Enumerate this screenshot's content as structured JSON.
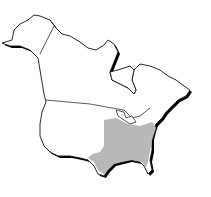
{
  "map": {
    "type": "range-map",
    "region": "North America",
    "shaded_region": "Eastern United States",
    "colors": {
      "background": "#ffffff",
      "land": "#ffffff",
      "outline": "#111111",
      "shadow": "#000000",
      "range_fill": "#b8b8b8"
    }
  }
}
